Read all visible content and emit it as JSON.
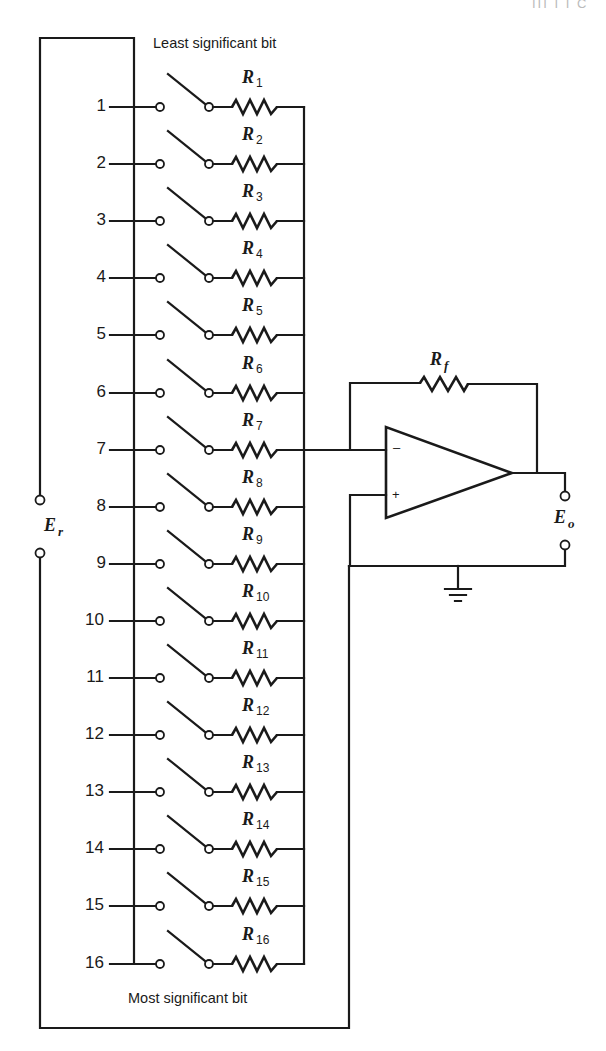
{
  "header_fragment": "III  I I C",
  "figure": {
    "lsb_label": "Least significant bit",
    "msb_label": "Most significant bit",
    "reference_source": {
      "symbol": "E",
      "subscript": "r"
    },
    "output": {
      "symbol": "E",
      "subscript": "o"
    },
    "feedback_resistor": {
      "symbol": "R",
      "subscript": "f"
    },
    "opamp": {
      "inverting_sign": "–",
      "noninverting_sign": "+"
    },
    "ground": "ground-symbol",
    "bits": [
      {
        "index": "1",
        "resistor": "R",
        "sub": "1"
      },
      {
        "index": "2",
        "resistor": "R",
        "sub": "2"
      },
      {
        "index": "3",
        "resistor": "R",
        "sub": "3"
      },
      {
        "index": "4",
        "resistor": "R",
        "sub": "4"
      },
      {
        "index": "5",
        "resistor": "R",
        "sub": "5"
      },
      {
        "index": "6",
        "resistor": "R",
        "sub": "6"
      },
      {
        "index": "7",
        "resistor": "R",
        "sub": "7"
      },
      {
        "index": "8",
        "resistor": "R",
        "sub": "8"
      },
      {
        "index": "9",
        "resistor": "R",
        "sub": "9"
      },
      {
        "index": "10",
        "resistor": "R",
        "sub": "10"
      },
      {
        "index": "11",
        "resistor": "R",
        "sub": "11"
      },
      {
        "index": "12",
        "resistor": "R",
        "sub": "12"
      },
      {
        "index": "13",
        "resistor": "R",
        "sub": "13"
      },
      {
        "index": "14",
        "resistor": "R",
        "sub": "14"
      },
      {
        "index": "15",
        "resistor": "R",
        "sub": "15"
      },
      {
        "index": "16",
        "resistor": "R",
        "sub": "16"
      }
    ]
  },
  "colors": {
    "ink": "#1a1a1a",
    "paper": "#ffffff"
  }
}
